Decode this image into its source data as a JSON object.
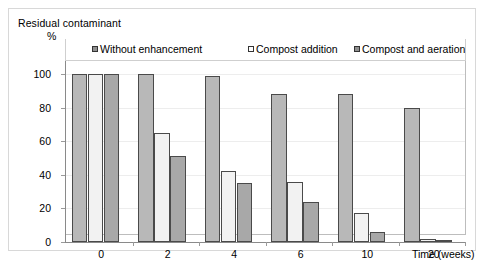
{
  "chart_data": {
    "type": "bar",
    "title": "Residual contaminant",
    "ylabel": "%",
    "xlabel": "Time (weeks)",
    "categories": [
      "0",
      "2",
      "4",
      "6",
      "10",
      "20"
    ],
    "yticks": [
      "0",
      "20",
      "40",
      "60",
      "80",
      "100"
    ],
    "ylim": [
      0,
      100
    ],
    "grid": true,
    "legend_position": "top",
    "series": [
      {
        "name": "Without enhancement",
        "values": [
          100,
          100,
          99,
          88,
          88,
          80
        ]
      },
      {
        "name": "Compost addition",
        "values": [
          100,
          65,
          42,
          36,
          17,
          2
        ]
      },
      {
        "name": "Compost and aeration",
        "values": [
          100,
          51,
          35,
          24,
          6,
          1
        ]
      }
    ],
    "colors": {
      "series_0": "#b8b8b8",
      "series_1": "#f2f2f2",
      "series_2": "#a8a8a8",
      "bar_outline": "#4a4a4a",
      "gridline": "#ededed",
      "axis": "#8a8a8a"
    }
  }
}
